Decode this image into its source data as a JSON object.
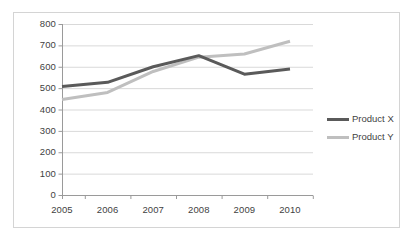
{
  "chart_data": {
    "type": "line",
    "title": "",
    "subtitle": "",
    "xlabel": "",
    "ylabel": "",
    "categories": [
      "2005",
      "2006",
      "2007",
      "2008",
      "2009",
      "2010"
    ],
    "series": [
      {
        "name": "Product X",
        "color": "#5a5a5a",
        "values": [
          508,
          527,
          600,
          652,
          565,
          589
        ]
      },
      {
        "name": "Product Y",
        "color": "#bfbfbf",
        "values": [
          447,
          480,
          578,
          645,
          660,
          719
        ]
      }
    ],
    "ylim": [
      0,
      800
    ],
    "yticks": [
      "0",
      "100",
      "200",
      "300",
      "400",
      "500",
      "600",
      "700",
      "800"
    ],
    "xticks": [
      "2005",
      "2006",
      "2007",
      "2008",
      "2009",
      "2010"
    ],
    "grid": true,
    "grid_axis": "y",
    "legend_position": "right",
    "plot_background": "#ffffff",
    "grid_color": "#d9d9d9",
    "axis_color": "#9a9a9a",
    "border_color": "#d4d4d4",
    "tick_label_color": "#3f3f3f"
  },
  "legend": {
    "items": [
      {
        "label": "Product X",
        "color": "#5a5a5a"
      },
      {
        "label": "Product Y",
        "color": "#bfbfbf"
      }
    ]
  }
}
